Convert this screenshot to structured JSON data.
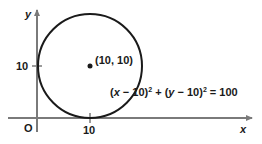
{
  "diagram": {
    "type": "circle-on-coordinate-plane",
    "axes": {
      "x_label": "x",
      "y_label": "y",
      "origin_label": "O",
      "x_tick_label": "10",
      "y_tick_label": "10"
    },
    "circle": {
      "center": [
        10,
        10
      ],
      "radius": 10,
      "center_label": "(10, 10)",
      "tangent_to": [
        "x-axis",
        "y-axis"
      ]
    },
    "equation": {
      "text": "(x − 10)² + (y − 10)² = 100",
      "part1": "(",
      "var_x": "x",
      "part2": " − 10)",
      "sup1": "2",
      "part3": " + (",
      "var_y": "y",
      "part4": " − 10)",
      "sup2": "2",
      "part5": " = 100"
    },
    "colors": {
      "axis": "#7a7a7a",
      "circle": "#1a1a1a",
      "text": "#1a1a1a",
      "background": "#ffffff"
    }
  }
}
